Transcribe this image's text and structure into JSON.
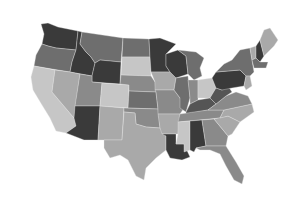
{
  "map": {
    "type": "choropleth",
    "region": "United States",
    "colors": {
      "darkest": "#3a3a3a",
      "dark": "#555555",
      "mid_dark": "#6e6e6e",
      "mid": "#8a8a8a",
      "light": "#a9a9a9",
      "lightest": "#c6c6c6"
    },
    "states": [
      {
        "id": "WA",
        "shade": "darkest"
      },
      {
        "id": "OR",
        "shade": "mid_dark"
      },
      {
        "id": "CA",
        "shade": "lightest"
      },
      {
        "id": "ID",
        "shade": "darkest"
      },
      {
        "id": "NV",
        "shade": "light"
      },
      {
        "id": "MT",
        "shade": "mid_dark"
      },
      {
        "id": "WY",
        "shade": "darkest"
      },
      {
        "id": "UT",
        "shade": "mid"
      },
      {
        "id": "AZ",
        "shade": "darkest"
      },
      {
        "id": "CO",
        "shade": "lightest"
      },
      {
        "id": "NM",
        "shade": "light"
      },
      {
        "id": "ND",
        "shade": "mid_dark"
      },
      {
        "id": "SD",
        "shade": "lightest"
      },
      {
        "id": "NE",
        "shade": "mid"
      },
      {
        "id": "KS",
        "shade": "mid_dark"
      },
      {
        "id": "OK",
        "shade": "mid"
      },
      {
        "id": "TX",
        "shade": "light"
      },
      {
        "id": "MN",
        "shade": "darkest"
      },
      {
        "id": "IA",
        "shade": "light"
      },
      {
        "id": "MO",
        "shade": "mid"
      },
      {
        "id": "AR",
        "shade": "light"
      },
      {
        "id": "LA",
        "shade": "darkest"
      },
      {
        "id": "WI",
        "shade": "darkest"
      },
      {
        "id": "IL",
        "shade": "mid_dark"
      },
      {
        "id": "MI",
        "shade": "mid_dark"
      },
      {
        "id": "IN",
        "shade": "mid"
      },
      {
        "id": "OH",
        "shade": "lightest"
      },
      {
        "id": "KY",
        "shade": "dark"
      },
      {
        "id": "TN",
        "shade": "mid"
      },
      {
        "id": "MS",
        "shade": "lightest"
      },
      {
        "id": "AL",
        "shade": "darkest"
      },
      {
        "id": "GA",
        "shade": "mid"
      },
      {
        "id": "FL",
        "shade": "mid"
      },
      {
        "id": "SC",
        "shade": "light"
      },
      {
        "id": "NC",
        "shade": "light"
      },
      {
        "id": "VA",
        "shade": "mid"
      },
      {
        "id": "WV",
        "shade": "dark"
      },
      {
        "id": "PA",
        "shade": "darkest"
      },
      {
        "id": "NY",
        "shade": "mid_dark"
      },
      {
        "id": "NJ",
        "shade": "light"
      },
      {
        "id": "VT",
        "shade": "light"
      },
      {
        "id": "NH",
        "shade": "darkest"
      },
      {
        "id": "ME",
        "shade": "light"
      },
      {
        "id": "MA",
        "shade": "mid_dark"
      }
    ]
  }
}
